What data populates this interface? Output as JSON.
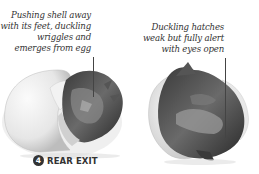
{
  "panels": [
    {
      "caption_lines": [
        "Pushing shell away",
        "with its feet, duckling",
        "wriggles and",
        "emerges from egg"
      ]
    },
    {
      "caption_lines": [
        "Duckling hatches",
        "weak but fully alert",
        "with eyes open"
      ]
    }
  ],
  "stage": {
    "number": "4",
    "label": "REAR EXIT"
  },
  "colors": {
    "text": "#333333",
    "badge": "#333333",
    "background": "#ffffff"
  }
}
